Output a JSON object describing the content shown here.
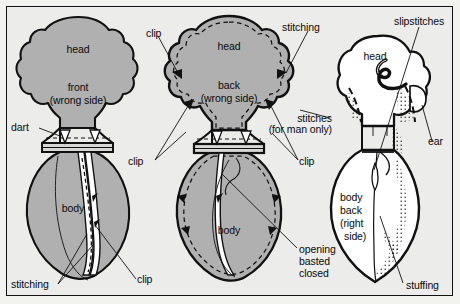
{
  "figure": {
    "type": "sewing-instruction-diagram",
    "background_color": "#ececeb",
    "fabric_fill_color": "#b0b0b0",
    "line_color": "#111111",
    "panel_count": 3
  },
  "panels": [
    {
      "id": "front-piece",
      "side": "wrong side",
      "fill": "shaded",
      "labels": [
        "head",
        "front",
        "(wrong side)",
        "body"
      ],
      "callouts": [
        "dart",
        "stitching",
        "clip"
      ]
    },
    {
      "id": "back-piece",
      "side": "wrong side",
      "fill": "shaded",
      "labels": [
        "head",
        "back",
        "(wrong side)",
        "body"
      ],
      "callouts": [
        "clip",
        "stitching",
        "clip",
        "clip",
        "stitches",
        "(for man only)",
        "opening",
        "basted",
        "closed"
      ]
    },
    {
      "id": "body-back-piece",
      "side": "right side",
      "fill": "white",
      "labels": [
        "head",
        "body",
        "back",
        "(right",
        "side)"
      ],
      "callouts": [
        "slipstitches",
        "ear",
        "stuffing"
      ]
    }
  ],
  "annotations": {
    "head_1": "head",
    "front": "front",
    "front_side": "(wrong side)",
    "dart": "dart",
    "body_1": "body",
    "stitching_1": "stitching",
    "clip_1": "clip",
    "clip_2": "clip",
    "head_2": "head",
    "back": "back",
    "back_side": "(wrong side)",
    "stitching_2": "stitching",
    "clip_3": "clip",
    "clip_4": "clip",
    "body_2": "body",
    "stitches": "stitches",
    "for_man_only": "(for man only)",
    "opening": "opening",
    "basted": "basted",
    "closed": "closed",
    "slipstitches": "slipstitches",
    "head_3": "head",
    "ear": "ear",
    "body_back_1": "body",
    "body_back_2": "back",
    "body_back_3": "(right",
    "body_back_4": "side)",
    "stuffing": "stuffing"
  }
}
